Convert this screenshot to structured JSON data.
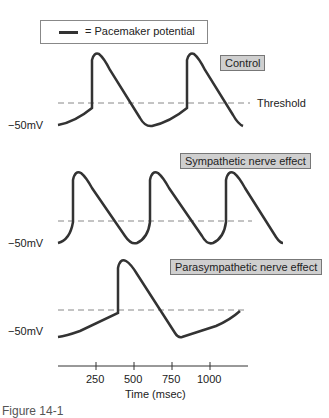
{
  "legend": {
    "symbol": "thick-line",
    "text": "= Pacemaker potential"
  },
  "panels": [
    {
      "title": "Control",
      "ylabel": "−50mV",
      "threshold_label": "Threshold"
    },
    {
      "title": "Sympathetic nerve effect",
      "ylabel": "−50mV"
    },
    {
      "title": "Parasympathetic nerve effect",
      "ylabel": "−50mV"
    }
  ],
  "axis": {
    "ticks": [
      "250",
      "500",
      "750",
      "1000"
    ],
    "xlabel": "Time (msec)"
  },
  "caption": "Figure 14-1",
  "colors": {
    "trace": "#333333",
    "threshold": "#888888",
    "badge_bg": "#cfcfcf"
  }
}
